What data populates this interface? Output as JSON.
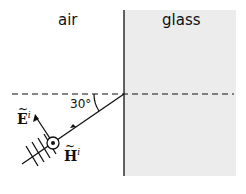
{
  "diagram": {
    "regions": [
      {
        "name": "air",
        "label": "air"
      },
      {
        "name": "glass",
        "label": "glass",
        "fill": "#ececec"
      }
    ],
    "angle": {
      "label": "30°",
      "value_deg": 30
    },
    "vectors": {
      "E": {
        "symbol": "E",
        "superscript": "i"
      },
      "H": {
        "symbol": "H",
        "superscript": "i"
      }
    },
    "colors": {
      "line": "#111111",
      "glass_fill": "#ececec",
      "background": "#ffffff"
    }
  }
}
